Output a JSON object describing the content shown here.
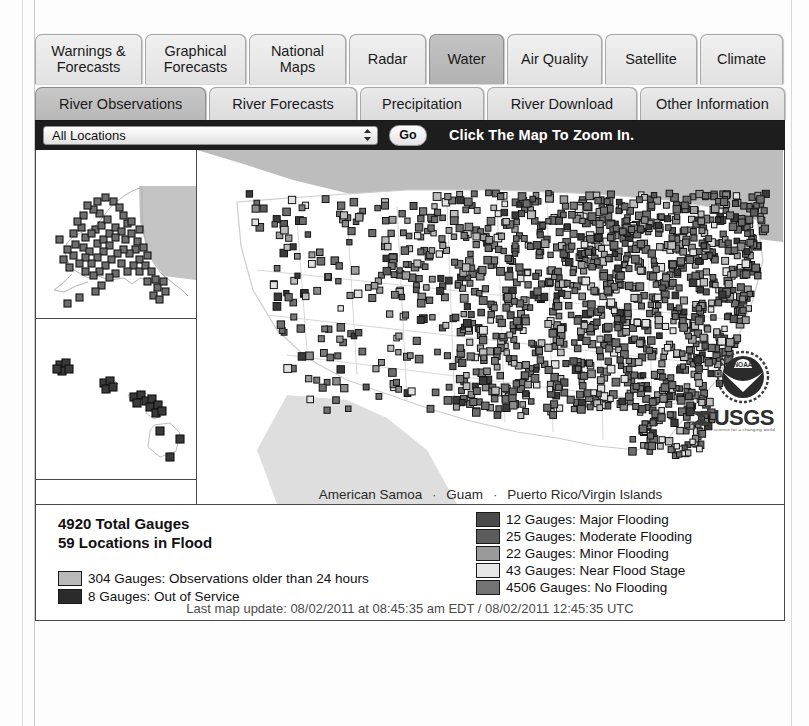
{
  "nav": {
    "primary_tabs": [
      {
        "label": "Warnings &\nForecasts",
        "active": false
      },
      {
        "label": "Graphical\nForecasts",
        "active": false
      },
      {
        "label": "National\nMaps",
        "active": false
      },
      {
        "label": "Radar",
        "active": false
      },
      {
        "label": "Water",
        "active": true
      },
      {
        "label": "Air Quality",
        "active": false
      },
      {
        "label": "Satellite",
        "active": false
      },
      {
        "label": "Climate",
        "active": false
      }
    ],
    "secondary_tabs": [
      {
        "label": "River Observations",
        "active": true
      },
      {
        "label": "River Forecasts",
        "active": false
      },
      {
        "label": "Precipitation",
        "active": false
      },
      {
        "label": "River Download",
        "active": false
      },
      {
        "label": "Other Information",
        "active": false
      }
    ]
  },
  "toolbar": {
    "location_select_value": "All Locations",
    "go_label": "Go",
    "hint": "Click The Map To Zoom In."
  },
  "map": {
    "caption_items": [
      "American Samoa",
      "Guam",
      "Puerto Rico/Virgin Islands"
    ],
    "caption_separator": "·",
    "usgs_text": "USGS",
    "usgs_tagline": "science for a changing world",
    "noaa_text": "NOAA"
  },
  "legend": {
    "total_gauges": "4920 Total Gauges",
    "locations_in_flood": "59 Locations in Flood",
    "left_items": [
      {
        "label": "304 Gauges: Observations older than 24 hours",
        "color": "#b9b9b9"
      },
      {
        "label": "8 Gauges: Out of Service",
        "color": "#2b2b2b"
      }
    ],
    "right_items": [
      {
        "label": "12 Gauges: Major Flooding",
        "color": "#4a4a4a"
      },
      {
        "label": "25 Gauges: Moderate Flooding",
        "color": "#5c5c5c"
      },
      {
        "label": "22 Gauges: Minor Flooding",
        "color": "#9a9a9a"
      },
      {
        "label": "43 Gauges: Near Flood Stage",
        "color": "#e2e2e2"
      },
      {
        "label": "4506 Gauges: No Flooding",
        "color": "#737373"
      }
    ],
    "last_update": "Last map update: 08/02/2011 at 08:45:35 am EDT / 08/02/2011 12:45:35 UTC"
  },
  "chart_data": {
    "type": "table",
    "categories": [
      "Major Flooding",
      "Moderate Flooding",
      "Minor Flooding",
      "Near Flood Stage",
      "No Flooding",
      "Observations older than 24 hours",
      "Out of Service"
    ],
    "values": [
      12,
      25,
      22,
      43,
      4506,
      304,
      8
    ],
    "total_gauges": 4920,
    "locations_in_flood": 59,
    "xlabel": "Gauge status",
    "ylabel": "Number of gauges"
  }
}
